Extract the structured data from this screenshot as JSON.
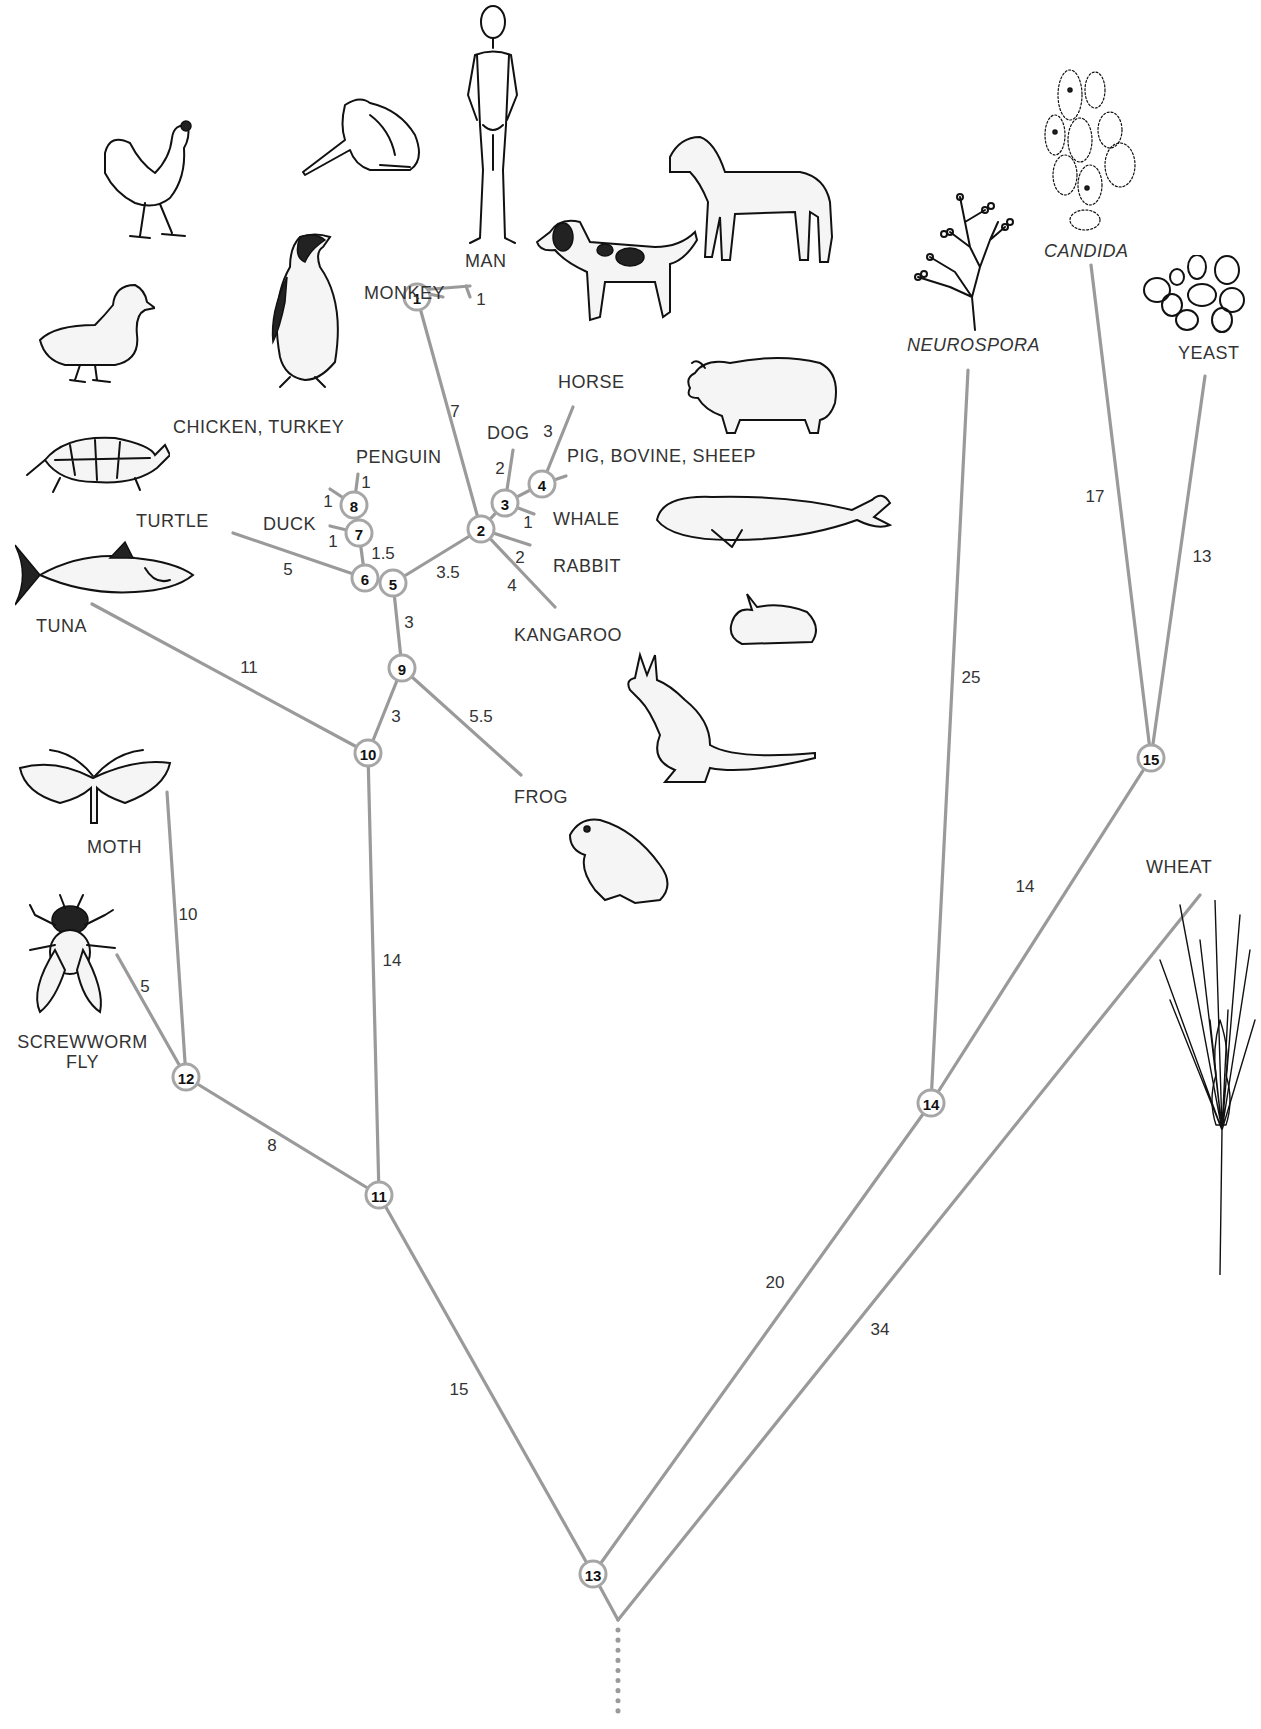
{
  "diagram": {
    "type": "phylogenetic-tree",
    "taxa": {
      "man": "MAN",
      "monkey": "MONKEY",
      "horse": "HORSE",
      "dog": "DOG",
      "pig_bovine_sheep": "PIG, BOVINE, SHEEP",
      "whale": "WHALE",
      "rabbit": "RABBIT",
      "kangaroo": "KANGAROO",
      "chicken_turkey": "CHICKEN, TURKEY",
      "penguin": "PENGUIN",
      "duck": "DUCK",
      "turtle": "TURTLE",
      "tuna": "TUNA",
      "frog": "FROG",
      "moth": "MOTH",
      "screwworm_fly_line1": "SCREWWORM",
      "screwworm_fly_line2": "FLY",
      "neurospora": "NEUROSPORA",
      "candida": "CANDIDA",
      "yeast": "YEAST",
      "wheat": "WHEAT"
    },
    "nodes": [
      "1",
      "2",
      "3",
      "4",
      "5",
      "6",
      "7",
      "8",
      "9",
      "10",
      "11",
      "12",
      "13",
      "14",
      "15"
    ],
    "edges": [
      {
        "from": "1",
        "to": "MAN",
        "length": "1"
      },
      {
        "from": "1",
        "to": "MONKEY",
        "length": ""
      },
      {
        "from": "2",
        "to": "1",
        "length": "7"
      },
      {
        "from": "3",
        "to": "DOG",
        "length": "2"
      },
      {
        "from": "4",
        "to": "HORSE",
        "length": "3"
      },
      {
        "from": "4",
        "to": "PIG, BOVINE, SHEEP",
        "length": ""
      },
      {
        "from": "3",
        "to": "WHALE",
        "length": "1"
      },
      {
        "from": "2",
        "to": "RABBIT",
        "length": "2"
      },
      {
        "from": "2",
        "to": "KANGAROO",
        "length": "4"
      },
      {
        "from": "5",
        "to": "2",
        "length": "3.5"
      },
      {
        "from": "6",
        "to": "7",
        "length": "1.5"
      },
      {
        "from": "6",
        "to": "TURTLE",
        "length": "5"
      },
      {
        "from": "7",
        "to": "DUCK",
        "length": "1"
      },
      {
        "from": "8",
        "to": "CHICKEN, TURKEY",
        "length": "1"
      },
      {
        "from": "8",
        "to": "PENGUIN",
        "length": "1"
      },
      {
        "from": "9",
        "to": "5",
        "length": "3"
      },
      {
        "from": "9",
        "to": "FROG",
        "length": "5.5"
      },
      {
        "from": "10",
        "to": "9",
        "length": "3"
      },
      {
        "from": "10",
        "to": "TUNA",
        "length": "11"
      },
      {
        "from": "11",
        "to": "10",
        "length": "14"
      },
      {
        "from": "12",
        "to": "MOTH",
        "length": "10"
      },
      {
        "from": "12",
        "to": "SCREWWORM FLY",
        "length": "5"
      },
      {
        "from": "11",
        "to": "12",
        "length": "8"
      },
      {
        "from": "13",
        "to": "11",
        "length": "15"
      },
      {
        "from": "13",
        "to": "14",
        "length": "20"
      },
      {
        "from": "14",
        "to": "NEUROSPORA",
        "length": "25"
      },
      {
        "from": "14",
        "to": "15",
        "length": "14"
      },
      {
        "from": "15",
        "to": "CANDIDA",
        "length": "17"
      },
      {
        "from": "15",
        "to": "YEAST",
        "length": "13"
      },
      {
        "from": "root",
        "to": "WHEAT",
        "length": "34"
      }
    ],
    "colors": {
      "branch": "#9a9a9a",
      "node_border": "#a6a6a6",
      "text": "#333333",
      "background": "#ffffff"
    }
  }
}
